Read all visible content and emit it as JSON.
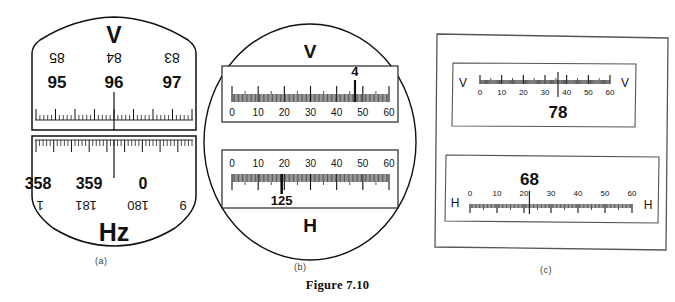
{
  "figure": {
    "caption": "Figure 7.10",
    "sub_captions": {
      "a": "(a)",
      "b": "(b)",
      "c": "(c)"
    }
  },
  "panel_a": {
    "name": "(a)",
    "vertical_dial": {
      "label": "V",
      "inverted_numbers": [
        "85",
        "84",
        "83"
      ],
      "upright_numbers": [
        "95",
        "96",
        "97"
      ],
      "pointer_reading": "96"
    },
    "horizontal_dial": {
      "label": "Hz",
      "upright_numbers": [
        "358",
        "359",
        "0"
      ],
      "inverted_numbers": [
        "1",
        "181",
        "180",
        "9"
      ],
      "pointer_reading": "359"
    }
  },
  "panel_b": {
    "name": "(b)",
    "v_scale": {
      "label": "V",
      "ticks": [
        "0",
        "10",
        "20",
        "30",
        "40",
        "50",
        "60"
      ],
      "min": 0,
      "max": 60,
      "pointer_position": 47,
      "pointer_value": "4"
    },
    "h_scale": {
      "label": "H",
      "ticks": [
        "0",
        "10",
        "20",
        "30",
        "40",
        "50",
        "60"
      ],
      "min": 0,
      "max": 60,
      "pointer_position": 19,
      "pointer_value": "125"
    }
  },
  "panel_c": {
    "name": "(c)",
    "v_scale": {
      "label_left": "V",
      "label_right": "V",
      "ticks": [
        "0",
        "10",
        "20",
        "30",
        "40",
        "50",
        "60"
      ],
      "min": 0,
      "max": 60,
      "pointer_position": 36,
      "pointer_value": "78"
    },
    "h_scale": {
      "label_left": "H",
      "label_right": "H",
      "ticks": [
        "0",
        "10",
        "20",
        "30",
        "40",
        "50",
        "60"
      ],
      "min": 0,
      "max": 60,
      "pointer_position": 22,
      "pointer_value": "68"
    }
  },
  "colors": {
    "ink": "#111111",
    "caption": "#3a3a3a",
    "background": "#ffffff"
  }
}
